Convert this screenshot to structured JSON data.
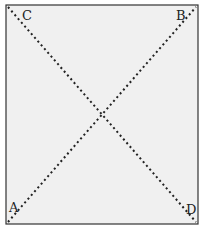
{
  "diagram": {
    "background": "#f0f0f0",
    "stroke": "#222222",
    "rect": {
      "x": 6,
      "y": 5,
      "w": 192,
      "h": 219
    },
    "corners": [
      {
        "label": "C",
        "x": 22,
        "y": 20
      },
      {
        "label": "B",
        "x": 180,
        "y": 20
      },
      {
        "label": "A",
        "x": 13,
        "y": 212
      },
      {
        "label": "D",
        "x": 189,
        "y": 214
      }
    ],
    "diagonals": [
      {
        "from": "C",
        "to": "D"
      },
      {
        "from": "A",
        "to": "B"
      }
    ]
  }
}
